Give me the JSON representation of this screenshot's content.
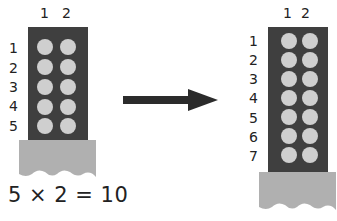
{
  "left_array": {
    "column_labels": [
      "1",
      "2"
    ],
    "row_labels": [
      "1",
      "2",
      "3",
      "4",
      "5"
    ],
    "rows": 5,
    "columns": 2,
    "equation": "5 × 2 = 10"
  },
  "right_array": {
    "column_labels": [
      "1",
      "2"
    ],
    "row_labels": [
      "1",
      "2",
      "3",
      "4",
      "5",
      "6",
      "7"
    ],
    "rows": 7,
    "columns": 2
  },
  "arrow": {
    "direction": "right"
  },
  "colors": {
    "array_background": "#3f3f3f",
    "dot": "#cfcfcf",
    "base": "#b0b0b0",
    "arrow": "#2b2b2b"
  }
}
